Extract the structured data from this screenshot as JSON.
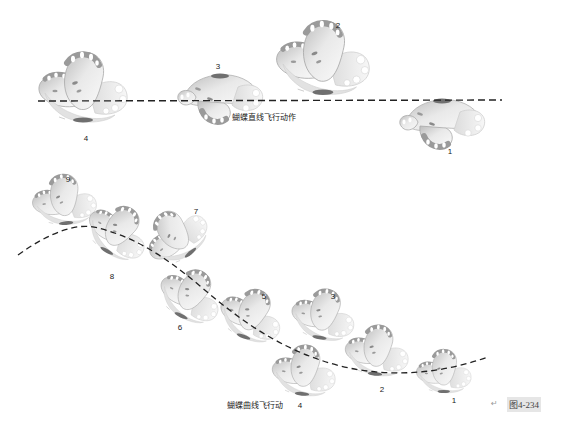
{
  "straight": {
    "caption": "蝴蝶直线飞行动作",
    "path": {
      "x1": 38,
      "y1": 101,
      "x2": 502,
      "y2": 100,
      "style": "dashed"
    },
    "butterflies": [
      {
        "label": "4",
        "x": 85,
        "y": 95,
        "scale": 1.0,
        "rot": 0,
        "label_x": 86,
        "label_y": 138
      },
      {
        "label": "3",
        "x": 218,
        "y": 95,
        "scale": 1.0,
        "rot": 0,
        "pose": "flat",
        "label_x": 218,
        "label_y": 66
      },
      {
        "label": "2",
        "x": 325,
        "y": 66,
        "scale": 1.05,
        "rot": 0,
        "label_x": 338,
        "label_y": 25
      },
      {
        "label": "1",
        "x": 440,
        "y": 120,
        "scale": 1.0,
        "rot": 0,
        "pose": "flat",
        "label_x": 450,
        "label_y": 151
      }
    ]
  },
  "curve": {
    "caption": "蝴蝶曲线飞行动",
    "butterflies": [
      {
        "label": "9",
        "x": 66,
        "y": 205,
        "scale": 0.72,
        "rot": -5,
        "label_x": 68,
        "label_y": 179
      },
      {
        "label": "8",
        "x": 117,
        "y": 236,
        "scale": 0.72,
        "rot": 30,
        "label_x": 112,
        "label_y": 276
      },
      {
        "label": "7",
        "x": 180,
        "y": 238,
        "scale": 0.72,
        "rot": -40,
        "label_x": 196,
        "label_y": 211
      },
      {
        "label": "6",
        "x": 190,
        "y": 300,
        "scale": 0.72,
        "rot": 25,
        "label_x": 180,
        "label_y": 327
      },
      {
        "label": "5",
        "x": 251,
        "y": 320,
        "scale": 0.72,
        "rot": 20,
        "label_x": 264,
        "label_y": 296
      },
      {
        "label": "3",
        "x": 324,
        "y": 320,
        "scale": 0.72,
        "rot": 10,
        "label_x": 333,
        "label_y": 296
      },
      {
        "label": "4",
        "x": 305,
        "y": 376,
        "scale": 0.72,
        "rot": 5,
        "label_x": 300,
        "label_y": 405
      },
      {
        "label": "2",
        "x": 378,
        "y": 356,
        "scale": 0.72,
        "rot": 5,
        "label_x": 382,
        "label_y": 389
      },
      {
        "label": "1",
        "x": 445,
        "y": 376,
        "scale": 0.62,
        "rot": 0,
        "label_x": 454,
        "label_y": 400
      }
    ]
  },
  "figure_number": "图4-234",
  "return_mark": "↵",
  "colors": {
    "wing_light": "#f4f4f4",
    "wing_mid": "#cfcfcf",
    "wing_dark": "#9a9a9a",
    "body": "#6f6f6f",
    "path": "#222222"
  }
}
